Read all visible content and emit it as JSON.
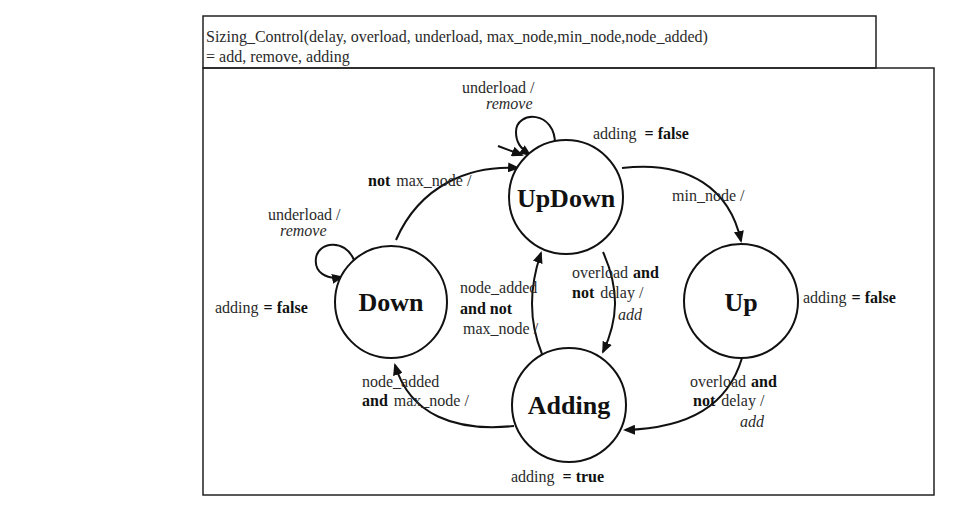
{
  "header": {
    "signature_line1": "Sizing_Control(delay, overload, underload, max_node,min_node,node_added)",
    "signature_line2": " = add, remove, adding"
  },
  "states": [
    {
      "id": "updown",
      "label": "UpDown",
      "output_label": "adding",
      "output_eq": "=",
      "output_value": "false"
    },
    {
      "id": "down",
      "label": "Down",
      "output_label": "adding",
      "output_eq": "=",
      "output_value": "false"
    },
    {
      "id": "up",
      "label": "Up",
      "output_label": "adding",
      "output_eq": "=",
      "output_value": "false"
    },
    {
      "id": "adding",
      "label": "Adding",
      "output_label": "adding",
      "output_eq": "=",
      "output_value": "true"
    }
  ],
  "transitions": {
    "updown_self": {
      "guard": "underload /",
      "action": "remove"
    },
    "down_self": {
      "guard": "underload /",
      "action": "remove"
    },
    "down_to_updown": {
      "kw": "not",
      "guard": "max_node /"
    },
    "updown_to_up": {
      "guard": "min_node /"
    },
    "updown_to_adding": {
      "l1": "overload",
      "l1kw": "and",
      "l2kw": "not",
      "l2": "delay /",
      "action": "add"
    },
    "adding_to_updown": {
      "l1": "node_added",
      "l2": "and  not",
      "l3": "max_node /"
    },
    "up_to_adding": {
      "l1": "overload",
      "l1kw": "and",
      "l2kw": "not",
      "l2": "delay /",
      "action": "add"
    },
    "adding_to_down": {
      "l1": "node_added",
      "l2kw": "and",
      "l2": "max_node /"
    }
  }
}
